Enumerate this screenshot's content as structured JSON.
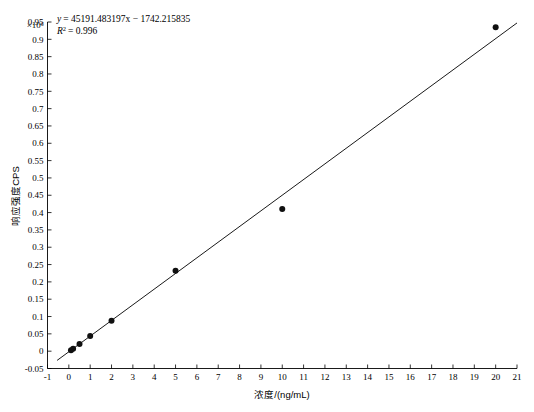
{
  "chart_data": {
    "type": "scatter",
    "title": "",
    "xlabel": "浓度/(ng/mL)",
    "ylabel": "响应强度CPS",
    "y_exponent_label": "×10⁶",
    "xlim": [
      -1,
      21
    ],
    "ylim": [
      -0.05,
      0.95
    ],
    "xticks": [
      -1,
      0,
      1,
      2,
      3,
      4,
      5,
      6,
      7,
      8,
      9,
      10,
      11,
      12,
      13,
      14,
      15,
      16,
      17,
      18,
      19,
      20,
      21
    ],
    "xtick_labels": [
      "-1",
      "0",
      "1",
      "2",
      "3",
      "4",
      "5",
      "6",
      "7",
      "8",
      "9",
      "10",
      "11",
      "12",
      "13",
      "14",
      "15",
      "16",
      "17",
      "18",
      "19",
      "20",
      "21"
    ],
    "yticks": [
      -0.05,
      0,
      0.05,
      0.1,
      0.15,
      0.2,
      0.25,
      0.3,
      0.35,
      0.4,
      0.45,
      0.5,
      0.55,
      0.6,
      0.65,
      0.7,
      0.75,
      0.8,
      0.85,
      0.9,
      0.95
    ],
    "ytick_labels": [
      "-0.05",
      "0",
      "0.05",
      "0.1",
      "0.15",
      "0.2",
      "0.25",
      "0.3",
      "0.35",
      "0.4",
      "0.45",
      "0.5",
      "0.55",
      "0.6",
      "0.65",
      "0.7",
      "0.75",
      "0.8",
      "0.85",
      "0.9",
      "0.95"
    ],
    "grid": false,
    "legend": false,
    "point_color": "#101010",
    "line_color": "#1a1a1a",
    "points": [
      {
        "x": 0.1,
        "y": 0.0025
      },
      {
        "x": 0.2,
        "y": 0.007
      },
      {
        "x": 0.5,
        "y": 0.021
      },
      {
        "x": 1.0,
        "y": 0.044
      },
      {
        "x": 2.0,
        "y": 0.088
      },
      {
        "x": 5.0,
        "y": 0.232
      },
      {
        "x": 10.0,
        "y": 0.41
      },
      {
        "x": 20.0,
        "y": 0.935
      }
    ],
    "fit": {
      "slope": 45191.483197,
      "intercept": -1742.215835,
      "r_squared": 0.996,
      "x_start": -0.55,
      "x_end": 21.0
    },
    "annotations": {
      "equation": "y = 45191.483197x − 1742.215835",
      "equation_lhs": "y",
      "equation_rhs": "= 45191.483197x − 1742.215835",
      "r2_symbol": "R",
      "r2_sup": "2",
      "r2_value": "= 0.996"
    }
  }
}
